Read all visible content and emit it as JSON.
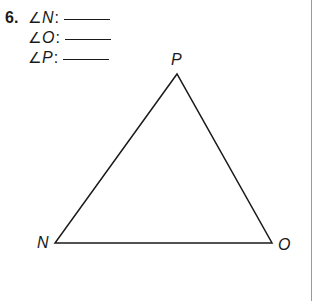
{
  "problem": {
    "number": "6.",
    "angles": [
      {
        "symbol": "∠",
        "vertex": "N",
        "colon": ":"
      },
      {
        "symbol": "∠",
        "vertex": "O",
        "colon": ":"
      },
      {
        "symbol": "∠",
        "vertex": "P",
        "colon": ":"
      }
    ]
  },
  "triangle": {
    "vertices": {
      "P": {
        "label": "P",
        "x": 177,
        "y": 74
      },
      "N": {
        "label": "N",
        "x": 55,
        "y": 243
      },
      "O": {
        "label": "O",
        "x": 272,
        "y": 243
      }
    },
    "stroke_color": "#1a1a1a"
  }
}
